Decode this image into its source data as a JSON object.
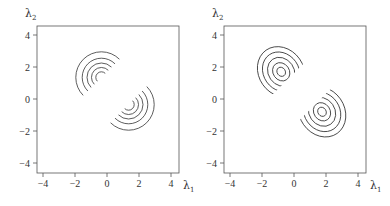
{
  "chart_data": [
    {
      "type": "contour",
      "title": "",
      "xlabel": "λ1",
      "ylabel": "λ2",
      "xlim": [
        -4.4,
        4.4
      ],
      "ylim": [
        -4.6,
        4.6
      ],
      "xticks": [
        -4,
        -2,
        0,
        2,
        4
      ],
      "yticks": [
        -4,
        -2,
        0,
        2,
        4
      ],
      "xtick_labels": [
        "-4",
        "-2",
        "0",
        "2",
        "4"
      ],
      "ytick_labels": [
        "-4",
        "-2",
        "0",
        "2",
        "4"
      ],
      "grid": false,
      "components": [
        {
          "name": "upper-left-mode",
          "shape": "circle",
          "center": [
            -0.35,
            1.35
          ],
          "radii": [
            0.35,
            0.62,
            0.9,
            1.2,
            1.6
          ],
          "aspect": [
            1,
            1
          ],
          "truncation_side": "upper-left"
        },
        {
          "name": "lower-right-mode",
          "shape": "circle",
          "center": [
            1.35,
            -0.35
          ],
          "radii": [
            0.35,
            0.62,
            0.9,
            1.2,
            1.6
          ],
          "aspect": [
            1,
            1
          ],
          "truncation_side": "lower-right"
        }
      ]
    },
    {
      "type": "contour",
      "title": "",
      "xlabel": "λ1",
      "ylabel": "λ2",
      "xlim": [
        -4.4,
        4.4
      ],
      "ylim": [
        -4.6,
        4.6
      ],
      "xticks": [
        -4,
        -2,
        0,
        2,
        4
      ],
      "yticks": [
        -4,
        -2,
        0,
        2,
        4
      ],
      "xtick_labels": [
        "-4",
        "-2",
        "0",
        "2",
        "4"
      ],
      "ytick_labels": [
        "-4",
        "-2",
        "0",
        "2",
        "4"
      ],
      "grid": false,
      "components": [
        {
          "name": "upper-left-mode",
          "shape": "ellipse",
          "center": [
            -0.8,
            1.7
          ],
          "radii": [
            0.3,
            0.6,
            0.95,
            1.3,
            1.65
          ],
          "aspect": [
            0.85,
            1.0
          ],
          "tilt_deg": 35,
          "truncation_side": "upper-left"
        },
        {
          "name": "lower-right-mode",
          "shape": "ellipse",
          "center": [
            1.75,
            -0.8
          ],
          "radii": [
            0.3,
            0.6,
            0.95,
            1.3,
            1.65
          ],
          "aspect": [
            0.85,
            1.0
          ],
          "tilt_deg": 35,
          "truncation_side": "lower-right"
        }
      ]
    }
  ],
  "labels": {
    "lambda": "λ",
    "sub1": "1",
    "sub2": "2"
  }
}
